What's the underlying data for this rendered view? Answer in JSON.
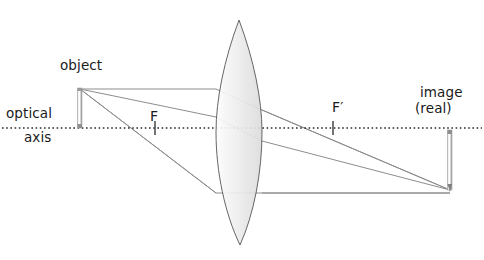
{
  "diagram": {
    "type": "optics-ray-diagram",
    "labels": {
      "object": "object",
      "optical": "optical",
      "axis": "axis",
      "image": "image",
      "image_qualifier": "(real)",
      "focal_point_near": "F",
      "focal_point_far": "F′"
    },
    "colors": {
      "background": "#ffffff",
      "text": "#1a1a1a",
      "ray": "#8c8c8c",
      "lens_outline": "#555555",
      "lens_fill_light": "#fbfbfb",
      "lens_fill_dark": "#d8d8d8",
      "axis": "#2b2b2b",
      "arrow_light": "#ffffff",
      "arrow_dark": "#8a8a8a"
    },
    "geometry": {
      "optical_axis_y": 128,
      "lens_center_x": 239,
      "lens_top_y": 20,
      "lens_bottom_y": 245,
      "lens_half_width": 23,
      "object_x": 80,
      "object_tip_y": 89,
      "image_x": 450,
      "image_tip_y": 190,
      "focal_near_x": 155,
      "focal_far_x": 333
    },
    "rays": [
      {
        "name": "parallel-ray",
        "description": "parallel to axis from object tip, refracts through far focal point"
      },
      {
        "name": "focal-ray",
        "description": "through near focal point F, exits parallel to axis"
      },
      {
        "name": "center-ray",
        "description": "through lens center, continues undeviated"
      }
    ],
    "markers": {
      "focal_tick_half_height": 7
    }
  }
}
